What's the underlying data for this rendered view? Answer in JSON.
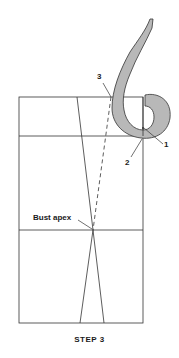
{
  "diagram": {
    "caption": "STEP 3",
    "labels": {
      "point_1": "1",
      "point_2": "2",
      "point_3": "3",
      "bust_apex": "Bust apex"
    },
    "colors": {
      "line": "#333333",
      "curve_fill": "#b8b8b8",
      "background": "#ffffff"
    },
    "elements": [
      "pattern-rectangle",
      "dart-lines",
      "dashed-guide-line",
      "french-curve"
    ]
  }
}
